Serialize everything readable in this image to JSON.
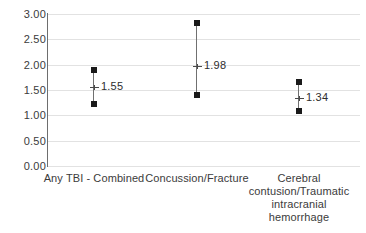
{
  "chart_data": {
    "type": "scatter",
    "subtype": "forest-plot-error-bars",
    "title": "",
    "subtitle": "",
    "xlabel": "",
    "ylabel": "",
    "ylim": [
      0.0,
      3.0
    ],
    "y_ticks": [
      "0.00",
      "0.50",
      "1.00",
      "1.50",
      "2.00",
      "2.50",
      "3.00"
    ],
    "y_tick_values": [
      0.0,
      0.5,
      1.0,
      1.5,
      2.0,
      2.5,
      3.0
    ],
    "grid": "horizontal",
    "legend": "none",
    "categories": [
      "Any TBI - Combined",
      "Concussion/Fracture",
      "Cerebral contusion/Traumatic intracranial hemorrhage"
    ],
    "category_lines": [
      [
        "Any TBI - Combined"
      ],
      [
        "Concussion/Fracture"
      ],
      [
        "Cerebral",
        "contusion/Traumatic",
        "intracranial",
        "hemorrhage"
      ]
    ],
    "values": [
      1.55,
      1.98,
      1.34
    ],
    "value_labels": [
      "1.55",
      "1.98",
      "1.34"
    ],
    "ci_lower": [
      1.22,
      1.4,
      1.08
    ],
    "ci_upper": [
      1.9,
      2.82,
      1.65
    ],
    "points": [
      {
        "category": "Any TBI - Combined",
        "estimate": 1.55,
        "estimate_label": "1.55",
        "ci_lower": 1.22,
        "ci_upper": 1.9
      },
      {
        "category": "Concussion/Fracture",
        "estimate": 1.98,
        "estimate_label": "1.98",
        "ci_lower": 1.4,
        "ci_upper": 2.82
      },
      {
        "category": "Cerebral contusion/Traumatic intracranial hemorrhage",
        "estimate": 1.34,
        "estimate_label": "1.34",
        "ci_lower": 1.08,
        "ci_upper": 1.65
      }
    ],
    "colors": {
      "background": "#ffffff",
      "gridline": "#e2e2e2",
      "axis": "#6e6e6e",
      "marker": "#1a1a1a",
      "ci_line": "#707070",
      "text": "#3b3b3b"
    }
  }
}
